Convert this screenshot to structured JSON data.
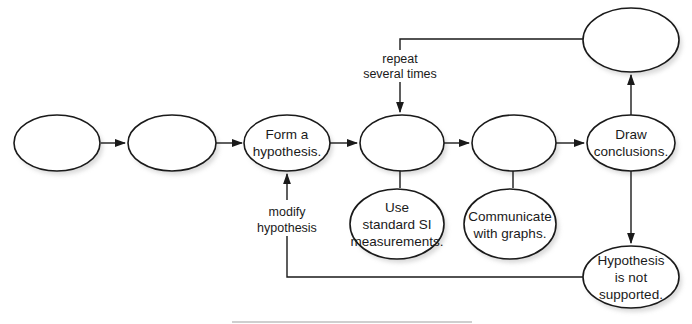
{
  "diagram": {
    "type": "flowchart",
    "title": "",
    "colors": {
      "stroke": "#1a1a1a",
      "fill": "#ffffff",
      "shadow": "#bdbdbd"
    },
    "nodes": [
      {
        "id": "n1",
        "lines": [
          "",
          ""
        ],
        "blank": true
      },
      {
        "id": "n2",
        "lines": [
          "",
          ""
        ],
        "blank": true
      },
      {
        "id": "n3",
        "lines": [
          "Form a",
          "hypothesis."
        ]
      },
      {
        "id": "n4",
        "lines": [
          "",
          ""
        ],
        "blank": true
      },
      {
        "id": "n5",
        "lines": [
          "",
          ""
        ],
        "blank": true
      },
      {
        "id": "n6",
        "lines": [
          "Draw",
          "conclusions."
        ]
      },
      {
        "id": "n7",
        "lines": [
          "",
          ""
        ],
        "blank": true
      },
      {
        "id": "n8",
        "lines": [
          "Use",
          "standard SI",
          "measurements."
        ]
      },
      {
        "id": "n9",
        "lines": [
          "Communicate",
          "with graphs."
        ]
      },
      {
        "id": "n10",
        "lines": [
          "Hypothesis",
          "is not",
          "supported."
        ]
      }
    ],
    "edges": [
      {
        "from": "n1",
        "to": "n2",
        "label": ""
      },
      {
        "from": "n2",
        "to": "n3",
        "label": ""
      },
      {
        "from": "n3",
        "to": "n4",
        "label": ""
      },
      {
        "from": "n4",
        "to": "n5",
        "label": ""
      },
      {
        "from": "n5",
        "to": "n6",
        "label": ""
      },
      {
        "from": "n6",
        "to": "n7",
        "label": ""
      },
      {
        "from": "n7",
        "to": "n4",
        "label_lines": [
          "repeat",
          "several times"
        ]
      },
      {
        "from": "n6",
        "to": "n10",
        "label": ""
      },
      {
        "from": "n10",
        "to": "n3",
        "label_lines": [
          "modify",
          "hypothesis"
        ]
      },
      {
        "from": "n4",
        "to": "n8",
        "label": "",
        "style": "line"
      },
      {
        "from": "n5",
        "to": "n9",
        "label": "",
        "style": "line"
      }
    ]
  }
}
